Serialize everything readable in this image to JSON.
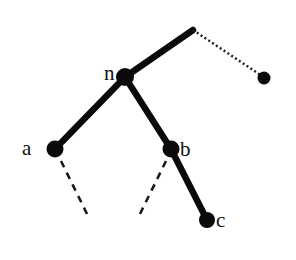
{
  "diagram": {
    "type": "tree",
    "colors": {
      "stroke": "#0a0a0a",
      "background": "#ffffff"
    },
    "nodes": [
      {
        "id": "n",
        "label": "n",
        "x": 125,
        "y": 77,
        "r": 9
      },
      {
        "id": "a",
        "label": "a",
        "x": 55,
        "y": 149,
        "r": 8.5
      },
      {
        "id": "b",
        "label": "b",
        "x": 171,
        "y": 149,
        "r": 8.5
      },
      {
        "id": "c",
        "label": "c",
        "x": 207,
        "y": 220,
        "r": 8
      },
      {
        "id": "right",
        "label": "",
        "x": 264,
        "y": 78,
        "r": 6.5
      }
    ],
    "edges": [
      {
        "from": "top",
        "to": "n",
        "style": "thick",
        "x1": 193,
        "y1": 30,
        "x2": 125,
        "y2": 77
      },
      {
        "from": "top",
        "to": "right",
        "style": "dotted",
        "x1": 193,
        "y1": 30,
        "x2": 262,
        "y2": 76
      },
      {
        "from": "n",
        "to": "a",
        "style": "thick",
        "x1": 125,
        "y1": 77,
        "x2": 55,
        "y2": 149
      },
      {
        "from": "n",
        "to": "b",
        "style": "thick",
        "x1": 125,
        "y1": 77,
        "x2": 171,
        "y2": 149
      },
      {
        "from": "b",
        "to": "c",
        "style": "thick",
        "x1": 171,
        "y1": 149,
        "x2": 207,
        "y2": 220
      },
      {
        "from": "a",
        "to": "subtree-a",
        "style": "dashed",
        "x1": 61,
        "y1": 161,
        "x2": 89,
        "y2": 218
      },
      {
        "from": "b",
        "to": "subtree-b",
        "style": "dashed",
        "x1": 166,
        "y1": 161,
        "x2": 138,
        "y2": 218
      }
    ],
    "labels": [
      {
        "text": "n",
        "x": 104,
        "y": 80
      },
      {
        "text": "a",
        "x": 22,
        "y": 155
      },
      {
        "text": "b",
        "x": 180,
        "y": 156
      },
      {
        "text": "c",
        "x": 216,
        "y": 227
      }
    ]
  }
}
